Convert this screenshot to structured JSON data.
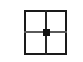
{
  "figure": {
    "background_color": "#ffffff",
    "width": 83,
    "height": 62
  },
  "chart_data": {
    "type": "diagram",
    "title": "",
    "subtitle": "",
    "xlabel": "",
    "ylabel": "",
    "grid": true,
    "legend": "none",
    "description": "A square outline subdivided into four equal quadrants by one vertical and one horizontal line, with a filled square dot at the central intersection point.",
    "shapes": [
      {
        "name": "outer-square",
        "kind": "rect",
        "x": 24,
        "y": 10,
        "width": 43,
        "height": 45,
        "stroke": "#1a1a1a",
        "stroke_width": 2,
        "fill": "none"
      },
      {
        "name": "vertical-divider",
        "kind": "line",
        "x1": 46,
        "y1": 10,
        "x2": 46,
        "y2": 55,
        "stroke": "#262626",
        "stroke_width": 2
      },
      {
        "name": "horizontal-divider",
        "kind": "line",
        "x1": 24,
        "y1": 32,
        "x2": 67,
        "y2": 32,
        "stroke": "#5a5a5a",
        "stroke_width": 2
      },
      {
        "name": "center-dot",
        "kind": "point",
        "cx": 46,
        "cy": 32,
        "size": 7,
        "fill": "#121212"
      }
    ],
    "quadrants": [
      {
        "name": "top-left",
        "x": 24,
        "y": 10,
        "width": 22,
        "height": 22
      },
      {
        "name": "top-right",
        "x": 46,
        "y": 10,
        "width": 21,
        "height": 22
      },
      {
        "name": "bottom-left",
        "x": 24,
        "y": 32,
        "width": 22,
        "height": 23
      },
      {
        "name": "bottom-right",
        "x": 46,
        "y": 32,
        "width": 21,
        "height": 23
      }
    ],
    "colors": {
      "background": "#ffffff",
      "outline": "#1a1a1a",
      "vertical_line": "#262626",
      "horizontal_line": "#5a5a5a",
      "marker": "#121212"
    }
  }
}
